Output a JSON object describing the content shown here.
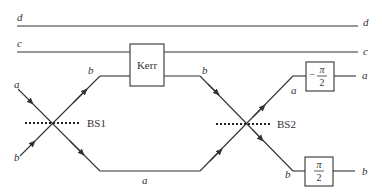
{
  "diagram": {
    "type": "optical-circuit",
    "rails": {
      "d": {
        "label_left": "d",
        "label_right": "d"
      },
      "c": {
        "label_left": "c",
        "label_right": "c"
      }
    },
    "inputs": {
      "top": "a",
      "bottom": "b"
    },
    "beam_splitters": [
      {
        "id": "bs1",
        "label": "BS1"
      },
      {
        "id": "bs2",
        "label": "BS2"
      }
    ],
    "arms": {
      "upper_label_in": "b",
      "upper_label_out": "b",
      "lower_label": "a"
    },
    "kerr": {
      "label": "Kerr"
    },
    "phase_shifters": [
      {
        "id": "neg-pi-over-2",
        "sign": "−",
        "numerator": "π",
        "denominator": "2",
        "input_label": "a",
        "output_label": "a"
      },
      {
        "id": "pi-over-2",
        "sign": "",
        "numerator": "π",
        "denominator": "2",
        "input_label": "b",
        "output_label": "b"
      }
    ]
  }
}
